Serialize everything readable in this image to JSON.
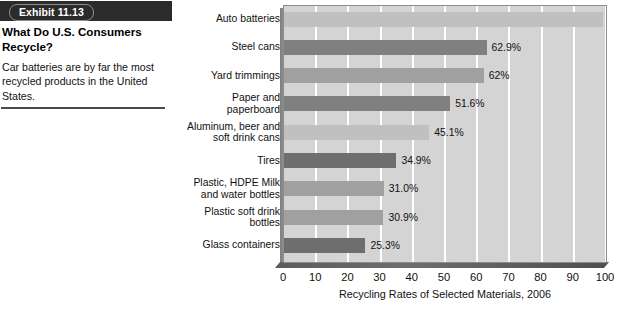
{
  "caption": {
    "exhibit_label": "Exhibit 11.13",
    "heading": "What Do U.S. Consumers Recycle?",
    "body": "Car batteries are by far the most recycled products in the United States."
  },
  "chart_data": {
    "type": "bar",
    "orientation": "horizontal",
    "title": "",
    "xlabel": "Recycling Rates of Selected Materials, 2006",
    "ylabel": "",
    "xlim": [
      0,
      100
    ],
    "xticks": [
      0,
      10,
      20,
      30,
      40,
      50,
      60,
      70,
      80,
      90,
      100
    ],
    "grid": "vertical-white",
    "legend": "none",
    "categories": [
      "Auto batteries",
      "Steel cans",
      "Yard trimmings",
      "Paper and paperboard",
      "Aluminum, beer and soft drink cans",
      "Tires",
      "Plastic, HDPE Milk and water bottles",
      "Plastic soft drink bottles",
      "Glass containers"
    ],
    "values": [
      99,
      62.9,
      62,
      51.6,
      45.1,
      34.9,
      31.0,
      30.9,
      25.3
    ],
    "data_labels": [
      "99%",
      "62.9%",
      "62%",
      "51.6%",
      "45.1%",
      "34.9%",
      "31.0%",
      "30.9%",
      "25.3%"
    ],
    "bar_shades": [
      "light",
      "dark",
      "mid",
      "dark",
      "light",
      "darker",
      "mid",
      "mid",
      "darker"
    ]
  },
  "colors": {
    "banner_background": "#2b2b2b",
    "banner_text": "#ffffff",
    "plot_background": "#d4d4d4",
    "gridline": "#ffffff",
    "bar_light": "#c0c0c0",
    "bar_mid": "#a0a0a0",
    "bar_dark": "#808080",
    "bar_darker": "#6e6e6e",
    "text": "#111111"
  }
}
